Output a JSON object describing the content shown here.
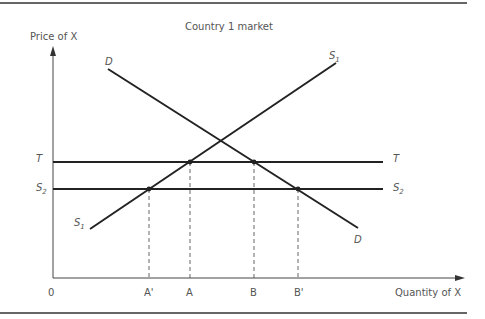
{
  "figure": {
    "title": "Country 1 market",
    "y_axis_label": "Price of X",
    "x_axis_label": "Quantity of X",
    "origin_label": "0"
  },
  "curves": {
    "demand": {
      "label_top": "D",
      "label_bottom": "D"
    },
    "supply": {
      "label_main": "S",
      "label_sub": "1"
    },
    "tariff_price": {
      "label_left": "T",
      "label_right": "T"
    },
    "world_supply": {
      "label_main": "S",
      "label_sub": "2"
    }
  },
  "x_ticks": [
    "A'",
    "A",
    "B",
    "B'"
  ],
  "colors": {
    "line": "#222222",
    "text": "#555555",
    "rule": "#333333"
  }
}
